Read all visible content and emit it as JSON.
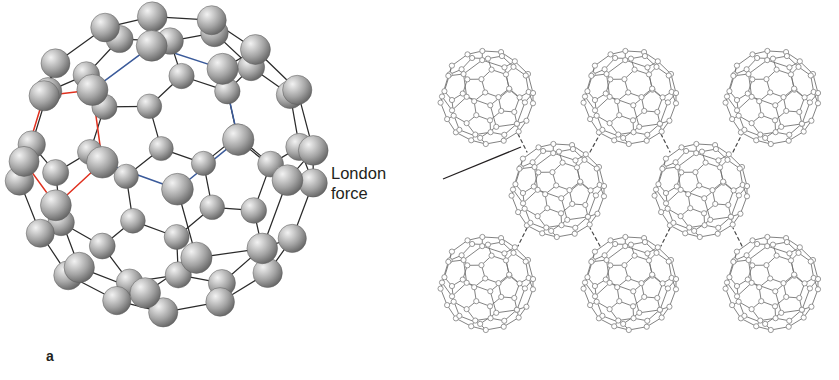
{
  "figure": {
    "background": "#ffffff"
  },
  "panels": [
    {
      "id": "a",
      "letter": "a",
      "caption": "",
      "description": "Ball-and-stick model of a single C60 buckminsterfullerene molecule with one pentagonal face highlighted in red and one hexagonal face highlighted in blue."
    },
    {
      "id": "b",
      "letter": "b",
      "caption": "",
      "description": "Eight C60 molecules drawn as wireframe cages in a close-packed arrangement, held together by London dispersion forces shown as dashed lines."
    }
  ],
  "annotations": [
    {
      "name": "london-force-label",
      "line1": "London",
      "line2": "force",
      "text": "London force",
      "leader": {
        "x1": 443,
        "y1": 179,
        "x2": 521,
        "y2": 147
      }
    }
  ],
  "colors": {
    "sphere_light": "#e6e6e6",
    "sphere_mid": "#a8a8a8",
    "sphere_dark": "#6e6e6e",
    "bond": "#2b2b2b",
    "pentagon_highlight": "#e0301e",
    "hexagon_highlight": "#3a5a9a",
    "wire": "#6b6b6b",
    "wire_node": "#8c8c8c",
    "dashed_force": "#4a4a4a",
    "text": "#231f20",
    "background": "#ffffff"
  },
  "molecule": {
    "name": "C60",
    "common_name": "buckminsterfullerene",
    "atom_count": 60,
    "bond_count": 90,
    "pentagon_faces": 12,
    "hexagon_faces": 20
  },
  "panel_a_layout": {
    "center_x": 167,
    "center_y": 163,
    "radius": 143,
    "sphere_radius": 15
  },
  "panel_b_layout": {
    "cage_radius": 45,
    "node_radius": 2.6,
    "rows": [
      {
        "y": 97,
        "centers_x": [
          487,
          630,
          772
        ]
      },
      {
        "y": 190,
        "centers_x": [
          558,
          701
        ]
      },
      {
        "y": 283,
        "centers_x": [
          487,
          630,
          772
        ]
      }
    ],
    "force_links": [
      {
        "x1": 518,
        "y1": 134,
        "x2": 527,
        "y2": 152
      },
      {
        "x1": 590,
        "y1": 152,
        "x2": 600,
        "y2": 134
      },
      {
        "x1": 661,
        "y1": 134,
        "x2": 670,
        "y2": 152
      },
      {
        "x1": 733,
        "y1": 152,
        "x2": 742,
        "y2": 134
      },
      {
        "x1": 527,
        "y1": 228,
        "x2": 518,
        "y2": 246
      },
      {
        "x1": 600,
        "y1": 246,
        "x2": 590,
        "y2": 228
      },
      {
        "x1": 670,
        "y1": 228,
        "x2": 661,
        "y2": 246
      },
      {
        "x1": 742,
        "y1": 246,
        "x2": 733,
        "y2": 228
      }
    ]
  }
}
